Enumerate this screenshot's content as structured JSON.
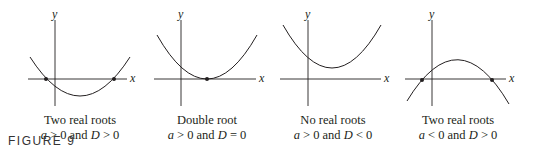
{
  "figure": {
    "label": "FIGURE 9",
    "axis_labels": {
      "x": "x",
      "y": "y"
    },
    "colors": {
      "curve": "#231f20",
      "axis": "#231f20",
      "text": "#231f20"
    },
    "panels": [
      {
        "title": "Two real roots",
        "condition": "a > 0 and D > 0",
        "shape": "upward parabola crossing x-axis twice"
      },
      {
        "title": "Double root",
        "condition": "a > 0 and D = 0",
        "shape": "upward parabola tangent to x-axis"
      },
      {
        "title": "No real roots",
        "condition": "a > 0 and D < 0",
        "shape": "upward parabola above x-axis"
      },
      {
        "title": "Two real roots",
        "condition": "a < 0 and D > 0",
        "shape": "downward parabola crossing x-axis twice"
      }
    ]
  }
}
